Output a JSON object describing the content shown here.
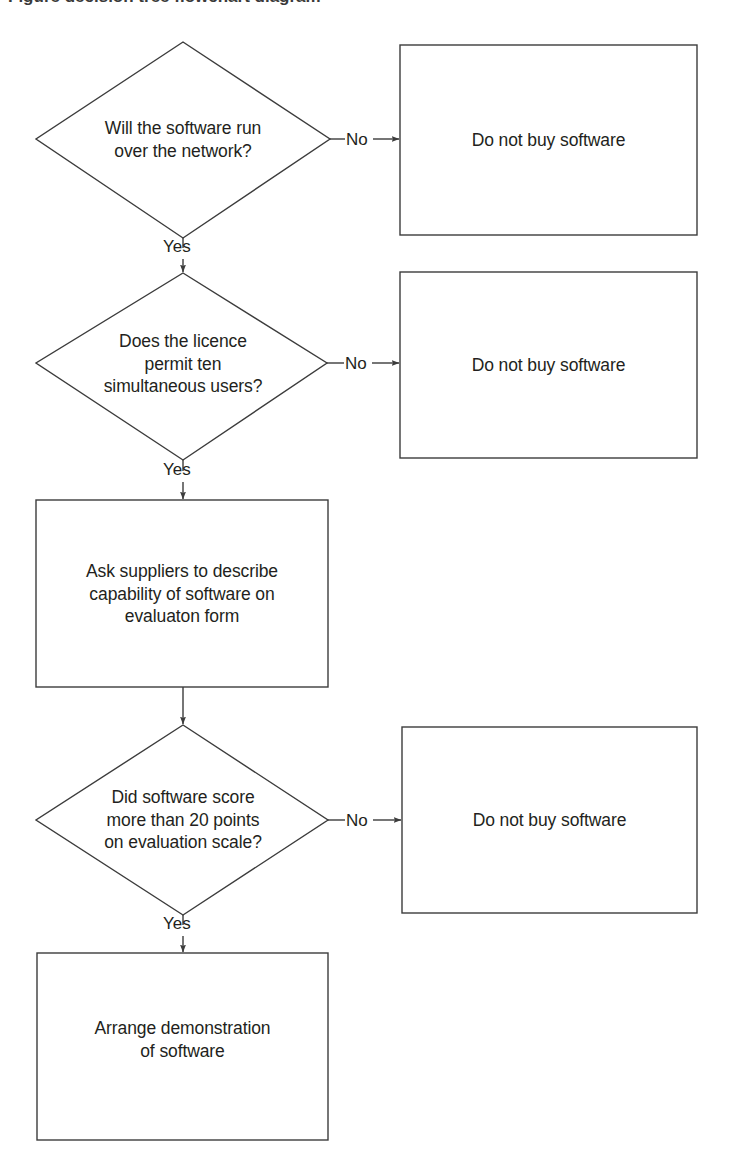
{
  "figure": {
    "type": "flowchart",
    "background_color": "#ffffff",
    "line_color": "#3c3c3c",
    "text_color": "#231f20",
    "partial_top_caption": "Figure  decision tree   flowchart diagram"
  },
  "nodes": {
    "decision1": {
      "id": "decision1",
      "shape": "diamond",
      "text": "Will the software run\nover the network?"
    },
    "outcome1": {
      "id": "outcome1",
      "shape": "rectangle",
      "text": "Do not buy software"
    },
    "decision2": {
      "id": "decision2",
      "shape": "diamond",
      "text": "Does the licence\npermit ten\nsimultaneous users?"
    },
    "outcome2": {
      "id": "outcome2",
      "shape": "rectangle",
      "text": "Do not buy software"
    },
    "process1": {
      "id": "process1",
      "shape": "rectangle",
      "text": "Ask suppliers to describe\ncapability of software on\nevaluaton form"
    },
    "decision3": {
      "id": "decision3",
      "shape": "diamond",
      "text": "Did software score\nmore than 20 points\non evaluation scale?"
    },
    "outcome3": {
      "id": "outcome3",
      "shape": "rectangle",
      "text": "Do not buy software"
    },
    "process2": {
      "id": "process2",
      "shape": "rectangle",
      "text": "Arrange demonstration\nof software"
    }
  },
  "edges": {
    "d1_no": {
      "label": "No",
      "from": "decision1",
      "to": "outcome1"
    },
    "d1_yes": {
      "label": "Yes",
      "from": "decision1",
      "to": "decision2"
    },
    "d2_no": {
      "label": "No",
      "from": "decision2",
      "to": "outcome2"
    },
    "d2_yes": {
      "label": "Yes",
      "from": "decision2",
      "to": "process1"
    },
    "p1_next": {
      "label": "",
      "from": "process1",
      "to": "decision3"
    },
    "d3_no": {
      "label": "No",
      "from": "decision3",
      "to": "outcome3"
    },
    "d3_yes": {
      "label": "Yes",
      "from": "decision3",
      "to": "process2"
    }
  }
}
